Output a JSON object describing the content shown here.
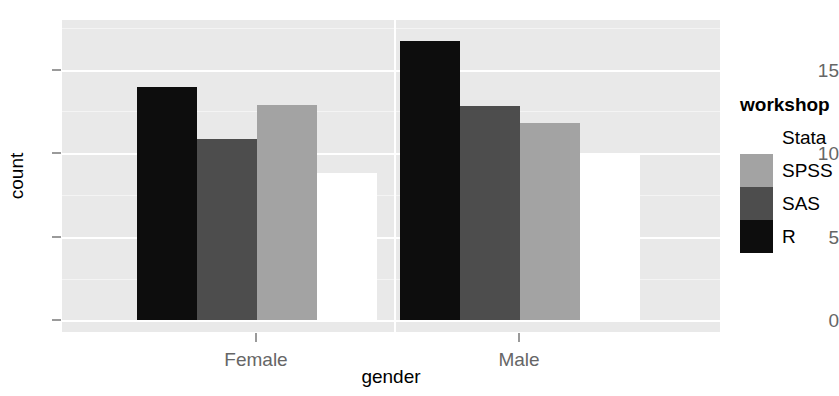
{
  "chart_data": {
    "type": "bar",
    "title": "",
    "xlabel": "gender",
    "ylabel": "count",
    "categories": [
      "Female",
      "Male"
    ],
    "legend_title": "workshop",
    "legend_position": "right",
    "grid": true,
    "ylim": [
      0,
      18.7
    ],
    "yticks": [
      0,
      5,
      10,
      15
    ],
    "ytick_labels": [
      "0",
      "5",
      "10",
      "15"
    ],
    "bar_mode": "dodge",
    "series": [
      {
        "name": "Stata",
        "color": "#ffffff",
        "values": [
          8.8,
          9.9
        ]
      },
      {
        "name": "SPSS",
        "color": "#a3a3a3",
        "values": [
          12.9,
          11.8
        ]
      },
      {
        "name": "SAS",
        "color": "#4d4d4d",
        "values": [
          10.85,
          12.85
        ]
      },
      {
        "name": "R",
        "color": "#0d0d0d",
        "values": [
          14.0,
          16.75
        ]
      }
    ],
    "draw_order": [
      "R",
      "SAS",
      "SPSS",
      "Stata"
    ],
    "panel_background": "#e9e9e9",
    "gridline_color": "#ffffff",
    "tick_label_color": "#666666",
    "axis_title_color": "#000000"
  },
  "yaxis": {
    "label": "count",
    "ticks": [
      {
        "value": "15",
        "y": 70
      },
      {
        "value": "10",
        "y": 153
      },
      {
        "value": "5",
        "y": 237
      },
      {
        "value": "0",
        "y": 320
      }
    ]
  },
  "xaxis": {
    "label": "gender",
    "ticks": [
      {
        "value": "Female",
        "x": 256
      },
      {
        "value": "Male",
        "x": 519
      }
    ]
  },
  "legend": {
    "title": "workshop",
    "items": [
      {
        "label": "Stata",
        "color": "#ffffff"
      },
      {
        "label": "SPSS",
        "color": "#a3a3a3"
      },
      {
        "label": "SAS",
        "color": "#4d4d4d"
      },
      {
        "label": "R",
        "color": "#0d0d0d"
      }
    ]
  },
  "bars": [
    {
      "group": "Female",
      "series": "R",
      "value": 14.0,
      "left": 137,
      "width": 60,
      "height": 233,
      "color": "#0d0d0d"
    },
    {
      "group": "Female",
      "series": "SAS",
      "value": 10.85,
      "left": 197,
      "width": 60,
      "height": 181,
      "color": "#4d4d4d"
    },
    {
      "group": "Female",
      "series": "SPSS",
      "value": 12.9,
      "left": 257,
      "width": 60,
      "height": 215,
      "color": "#a3a3a3"
    },
    {
      "group": "Female",
      "series": "Stata",
      "value": 8.8,
      "left": 317,
      "width": 60,
      "height": 147,
      "color": "#ffffff"
    },
    {
      "group": "Male",
      "series": "R",
      "value": 16.75,
      "left": 400,
      "width": 60,
      "height": 279,
      "color": "#0d0d0d"
    },
    {
      "group": "Male",
      "series": "SAS",
      "value": 12.85,
      "left": 460,
      "width": 60,
      "height": 214,
      "color": "#4d4d4d"
    },
    {
      "group": "Male",
      "series": "SPSS",
      "value": 11.8,
      "left": 520,
      "width": 60,
      "height": 197,
      "color": "#a3a3a3"
    },
    {
      "group": "Male",
      "series": "Stata",
      "value": 9.9,
      "left": 580,
      "width": 60,
      "height": 165,
      "color": "#ffffff"
    }
  ],
  "gridlines": {
    "major_y": [
      50,
      133,
      217,
      300
    ],
    "minor_y": [
      8,
      91,
      175,
      259
    ],
    "major_x": [
      332
    ]
  }
}
